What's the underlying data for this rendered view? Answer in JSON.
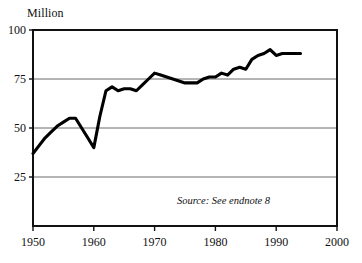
{
  "chart_data": {
    "type": "line",
    "title": "",
    "subtitle": "",
    "xlabel": "",
    "ylabel": "Million",
    "unit_label": "Million",
    "xlim": [
      1950,
      2000
    ],
    "ylim": [
      0,
      100
    ],
    "grid": true,
    "grid_axis": "y",
    "legend": null,
    "legend_position": "none",
    "x_ticks": [
      1950,
      1960,
      1970,
      1980,
      1990,
      2000
    ],
    "x_tick_labels": [
      "1950",
      "1960",
      "1970",
      "1980",
      "1990",
      "2000"
    ],
    "y_ticks": [
      25,
      50,
      75,
      100
    ],
    "y_tick_labels": [
      "25",
      "50",
      "75",
      "100"
    ],
    "annotations": [
      {
        "name": "source-note",
        "text": "Source: See endnote 8",
        "x": 1989,
        "y": 11,
        "style": "italic",
        "anchor": "end"
      }
    ],
    "series": [
      {
        "name": "value",
        "color": "#000000",
        "x": [
          1950,
          1951,
          1952,
          1953,
          1954,
          1955,
          1956,
          1957,
          1958,
          1959,
          1960,
          1961,
          1962,
          1963,
          1964,
          1965,
          1966,
          1967,
          1968,
          1969,
          1970,
          1971,
          1972,
          1973,
          1974,
          1975,
          1976,
          1977,
          1978,
          1979,
          1980,
          1981,
          1982,
          1983,
          1984,
          1985,
          1986,
          1987,
          1988,
          1989,
          1990,
          1991,
          1992,
          1993,
          1994
        ],
        "values": [
          37,
          41,
          45,
          48,
          51,
          53,
          55,
          55,
          50,
          45,
          40,
          56,
          69,
          71,
          69,
          70,
          70,
          69,
          72,
          75,
          78,
          77,
          76,
          75,
          74,
          73,
          73,
          73,
          75,
          76,
          76,
          78,
          77,
          80,
          81,
          80,
          85,
          87,
          88,
          90,
          87,
          88,
          88,
          88,
          88
        ]
      }
    ]
  },
  "layout": {
    "plot_left_px": 33,
    "plot_right_px": 337,
    "plot_top_px": 30,
    "plot_bottom_px": 226
  }
}
